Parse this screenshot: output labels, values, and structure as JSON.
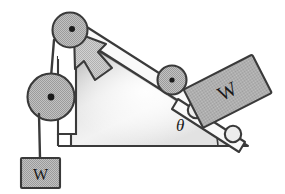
{
  "figure": {
    "type": "physics-free-body-diagram",
    "background_color": "#ffffff",
    "stroke_color": "#3a3a3a",
    "labels": {
      "hanging_weight": "W",
      "cart_weight": "W",
      "incline_angle": "θ"
    },
    "colors": {
      "body_fill": "#b2b2b2",
      "body_fill_light": "#c9c9c9",
      "ramp_fill_top": "#b8b8b8",
      "ramp_fill_mid": "#e8e8e8",
      "rail_fill": "#f7f7f7",
      "outline": "#3a3a3a",
      "hub_dot": "#1a1a1a",
      "text": "#1a1a1a"
    },
    "components": [
      {
        "name": "top-pulley",
        "label": "",
        "cx": 69,
        "cy": 31,
        "r": 17
      },
      {
        "name": "lower-pulley",
        "label": "",
        "cx": 51,
        "cy": 97,
        "r": 23
      },
      {
        "name": "idler-pulley",
        "label": "",
        "cx": 172,
        "cy": 80,
        "r": 14
      },
      {
        "name": "cart-wheel-upper",
        "label": "",
        "cx": 196,
        "cy": 110,
        "r": 8
      },
      {
        "name": "cart-wheel-lower",
        "label": "",
        "cx": 233,
        "cy": 133,
        "r": 8
      },
      {
        "name": "hanging-weight-block",
        "label": "W",
        "x": 22,
        "y": 158,
        "w": 38,
        "h": 30
      },
      {
        "name": "cart-body",
        "label": "W",
        "x": 189,
        "y": 70,
        "w": 76,
        "h": 42,
        "rotation_deg": -25
      },
      {
        "name": "pull-arrow",
        "label": "",
        "direction": "up-left"
      },
      {
        "name": "incline-ramp",
        "label": "",
        "angle_deg": 31
      },
      {
        "name": "angle-arc",
        "label": "θ"
      }
    ]
  }
}
